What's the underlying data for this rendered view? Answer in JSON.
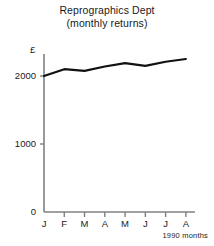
{
  "chart_data": {
    "type": "line",
    "title": "Reprographics Dept",
    "subtitle": "(monthly returns)",
    "xlabel": "1990 months",
    "ylabel": "£",
    "categories": [
      "J",
      "F",
      "M",
      "A",
      "M",
      "J",
      "J",
      "A"
    ],
    "category_names": [
      "January",
      "February",
      "March",
      "April",
      "May",
      "June",
      "July",
      "August"
    ],
    "values": [
      2000,
      2100,
      2075,
      2140,
      2190,
      2150,
      2210,
      2250
    ],
    "ylim": [
      0,
      2500
    ],
    "yticks": [
      0,
      1000,
      2000
    ],
    "ytick_labels": [
      "0",
      "1000",
      "2000"
    ],
    "grid": false,
    "legend": false,
    "line_color": "#111111",
    "axis_color": "#808080",
    "background": "#ffffff"
  },
  "axes": {
    "unit_label": "£",
    "x_note": "1990 months"
  }
}
